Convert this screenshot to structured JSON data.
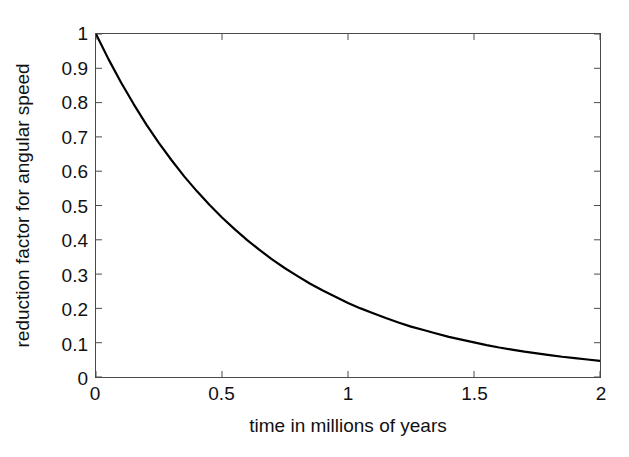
{
  "figure": {
    "background": "#ffffff",
    "axis_color": "#4a4a4a",
    "line_color": "#000000",
    "text_color": "#111111"
  },
  "chart_data": {
    "type": "line",
    "title": "",
    "xlabel": "time in millions of years",
    "ylabel": "reduction factor for angular speed",
    "xlim": [
      0,
      2
    ],
    "ylim": [
      0,
      1
    ],
    "grid": false,
    "legend": null,
    "xticks": [
      0,
      0.5,
      1,
      1.5,
      2
    ],
    "xtick_labels": [
      "0",
      "0.5",
      "1",
      "1.5",
      "2"
    ],
    "yticks": [
      0,
      0.1,
      0.2,
      0.3,
      0.4,
      0.5,
      0.6,
      0.7,
      0.8,
      0.9,
      1
    ],
    "ytick_labels": [
      "0",
      "0.1",
      "0.2",
      "0.3",
      "0.4",
      "0.5",
      "0.6",
      "0.7",
      "0.8",
      "0.9",
      "1"
    ],
    "series": [
      {
        "name": "reduction factor",
        "color": "#000000",
        "line_width": 2.2,
        "x": [
          0,
          0.05,
          0.1,
          0.15,
          0.2,
          0.25,
          0.3,
          0.35,
          0.4,
          0.45,
          0.5,
          0.55,
          0.6,
          0.65,
          0.7,
          0.75,
          0.8,
          0.85,
          0.9,
          0.95,
          1.0,
          1.05,
          1.1,
          1.15,
          1.2,
          1.25,
          1.3,
          1.35,
          1.4,
          1.45,
          1.5,
          1.55,
          1.6,
          1.65,
          1.7,
          1.75,
          1.8,
          1.85,
          1.9,
          1.95,
          2.0
        ],
        "values": [
          1.0,
          0.926,
          0.858,
          0.795,
          0.736,
          0.682,
          0.632,
          0.585,
          0.542,
          0.502,
          0.465,
          0.431,
          0.399,
          0.37,
          0.342,
          0.317,
          0.294,
          0.272,
          0.252,
          0.234,
          0.216,
          0.2,
          0.186,
          0.172,
          0.159,
          0.147,
          0.137,
          0.127,
          0.117,
          0.109,
          0.101,
          0.093,
          0.086,
          0.08,
          0.074,
          0.069,
          0.064,
          0.059,
          0.055,
          0.051,
          0.047
        ]
      }
    ]
  }
}
